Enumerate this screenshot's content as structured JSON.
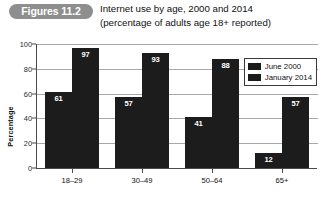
{
  "figure": {
    "badge_label": "Figures 11.2",
    "title_line_1": "Internet use by age, 2000 and 2014",
    "title_line_2": "(percentage of adults age 18+ reported)"
  },
  "chart_data": {
    "type": "bar",
    "title": "Internet use by age, 2000 and 2014",
    "subtitle": "(percentage of adults age 18+ reported)",
    "xlabel": "",
    "ylabel": "Percentage",
    "ylim": [
      0,
      100
    ],
    "yticks": [
      0,
      20,
      40,
      60,
      80,
      100
    ],
    "grid": true,
    "legend_position": "top-right",
    "categories": [
      "18–29",
      "30–49",
      "50–64",
      "65+"
    ],
    "series": [
      {
        "name": "June 2000",
        "values": [
          61,
          57,
          41,
          12
        ],
        "color": "#1c1c1c"
      },
      {
        "name": "January 2014",
        "values": [
          97,
          93,
          88,
          57
        ],
        "color": "#1c1c1c"
      }
    ]
  },
  "colors": {
    "badge_background": "#8e8e8e",
    "bar": "#1c1c1c",
    "grid": "#a8a8a8",
    "axis": "#4a4a4a"
  }
}
